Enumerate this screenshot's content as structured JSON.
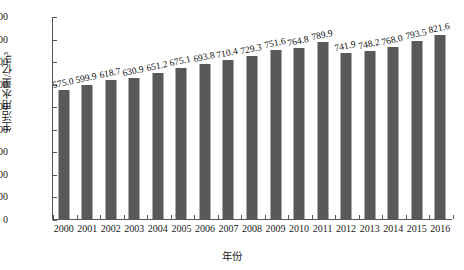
{
  "chart_data": {
    "type": "bar",
    "title": "",
    "xlabel": "年份",
    "ylabel": "生活用水量/亿m³",
    "categories": [
      "2000",
      "2001",
      "2002",
      "2003",
      "2004",
      "2005",
      "2006",
      "2007",
      "2008",
      "2009",
      "2010",
      "2011",
      "2012",
      "2013",
      "2014",
      "2015",
      "2016"
    ],
    "values": [
      575.0,
      599.9,
      618.7,
      630.9,
      651.2,
      675.1,
      693.8,
      710.4,
      729.3,
      751.6,
      764.8,
      789.9,
      741.9,
      748.2,
      768.0,
      793.5,
      821.6
    ],
    "value_labels": [
      "575.0",
      "599.9",
      "618.7",
      "630.9",
      "651.2",
      "675.1",
      "693.8",
      "710.4",
      "729.3",
      "751.6",
      "764.8",
      "789.9",
      "741.9",
      "748.2",
      "768.0",
      "793.5",
      "821.6"
    ],
    "ylim": [
      0,
      900
    ],
    "ytick_values": [
      0,
      100,
      200,
      300,
      400,
      500,
      600,
      700,
      800,
      900
    ],
    "ytick_labels": [
      "0",
      "100",
      "200",
      "300",
      "400",
      "500",
      "600",
      "700",
      "800",
      "900"
    ],
    "grid": false,
    "legend": false,
    "legend_position": "none",
    "series_color": "#595959",
    "axis_color": "#555555",
    "background_color": "#ffffff"
  }
}
